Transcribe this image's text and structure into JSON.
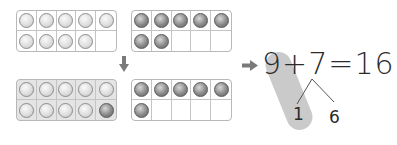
{
  "frames": [
    {
      "id": "top-left",
      "shaded": false,
      "cells": [
        "light",
        "light",
        "light",
        "light",
        "light",
        "light",
        "light",
        "light",
        "light",
        "empty"
      ]
    },
    {
      "id": "top-right",
      "shaded": false,
      "cells": [
        "dark",
        "dark",
        "dark",
        "dark",
        "dark",
        "dark",
        "dark",
        "empty",
        "empty",
        "empty"
      ]
    },
    {
      "id": "bottom-left",
      "shaded": true,
      "cells": [
        "light",
        "light",
        "light",
        "light",
        "light",
        "light",
        "light",
        "light",
        "light",
        "dark"
      ]
    },
    {
      "id": "bottom-right",
      "shaded": false,
      "cells": [
        "dark",
        "dark",
        "dark",
        "dark",
        "dark",
        "dark",
        "empty",
        "empty",
        "empty",
        "empty"
      ]
    }
  ],
  "equation": {
    "text": "9+7=16",
    "addend1": "9",
    "plus": "+",
    "addend2": "7",
    "equals": "=",
    "sum": "16"
  },
  "decomposition": {
    "left": "1",
    "right": "6"
  },
  "arrows": {
    "down": "arrow-down",
    "right": "arrow-right"
  },
  "colors": {
    "frame_border": "#b8b8b8",
    "shaded_frame": "#e4e4e4",
    "highlight_pill": "#c4c4c4",
    "text": "#2b2b2b",
    "arrow": "#7a7a7a"
  }
}
